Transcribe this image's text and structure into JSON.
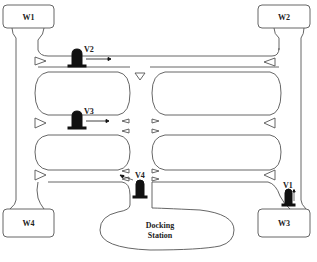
{
  "diagram": {
    "title": "",
    "colors": {
      "line": "#555555",
      "vehicle": "#111111",
      "background": "#ffffff"
    },
    "warehouses": [
      {
        "id": "W1",
        "label": "W1"
      },
      {
        "id": "W2",
        "label": "W2"
      },
      {
        "id": "W3",
        "label": "W3"
      },
      {
        "id": "W4",
        "label": "W4"
      }
    ],
    "vehicles": [
      {
        "id": "V1",
        "label": "V1",
        "direction": "up"
      },
      {
        "id": "V2",
        "label": "V2",
        "direction": "right"
      },
      {
        "id": "V3",
        "label": "V3",
        "direction": "right"
      },
      {
        "id": "V4",
        "label": "V4",
        "direction": "left"
      }
    ],
    "docking_station": {
      "line1": "Docking",
      "line2": "Station"
    }
  }
}
